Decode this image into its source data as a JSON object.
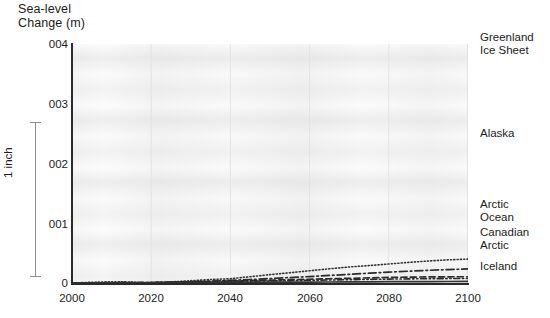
{
  "chart_data": {
    "type": "line",
    "title": "Sea-level\nChange (m)",
    "xlabel": "",
    "ylabel": "Sea-level Change (m)",
    "xlim": [
      2000,
      2100
    ],
    "ylim": [
      0,
      0.04
    ],
    "grid": true,
    "legend_position": "right-inline",
    "x_ticks": [
      "2000",
      "2020",
      "2040",
      "2060",
      "2080",
      "2100"
    ],
    "x_tick_values": [
      2000,
      2020,
      2040,
      2060,
      2080,
      2100
    ],
    "y_ticks": [
      "0",
      "001",
      "002",
      "003",
      "004"
    ],
    "y_tick_values": [
      0,
      0.001,
      0.002,
      0.003,
      0.004
    ],
    "scale_annotation": "1 inch",
    "x": [
      2000,
      2005,
      2010,
      2013,
      2016,
      2018,
      2020,
      2025,
      2030,
      2035,
      2040,
      2045,
      2050,
      2055,
      2060,
      2065,
      2070,
      2075,
      2080,
      2085,
      2090,
      2095,
      2100
    ],
    "series": [
      {
        "name": "Greenland Ice Sheet",
        "label": "Greenland\nIce Sheet",
        "style": "dotted",
        "color": "#333333",
        "values": [
          0.0,
          0.00012,
          0.00022,
          0.00021,
          0.00012,
          4e-05,
          3e-05,
          0.00018,
          0.00038,
          0.00058,
          0.00072,
          0.00105,
          0.0014,
          0.00172,
          0.00205,
          0.00238,
          0.00268,
          0.00292,
          0.00318,
          0.00345,
          0.00368,
          0.00388,
          0.004
        ]
      },
      {
        "name": "Alaska",
        "label": "Alaska",
        "style": "dash-dot",
        "color": "#2a2a2a",
        "values": [
          0.0,
          2e-05,
          4e-05,
          5e-05,
          6e-05,
          7e-05,
          8e-05,
          0.00014,
          0.00022,
          0.00032,
          0.00044,
          0.00058,
          0.00074,
          0.00091,
          0.00108,
          0.00126,
          0.00145,
          0.00164,
          0.00182,
          0.00198,
          0.00212,
          0.00225,
          0.00235
        ]
      },
      {
        "name": "Arctic Ocean",
        "label": "Arctic\nOcean",
        "style": "dashed",
        "color": "#2a2a2a",
        "values": [
          0.0,
          2e-05,
          4e-05,
          5e-05,
          6e-05,
          7e-05,
          8e-05,
          0.00013,
          0.00019,
          0.00026,
          0.00033,
          0.00041,
          0.00048,
          0.00056,
          0.00063,
          0.00071,
          0.00078,
          0.00086,
          0.00093,
          0.00098,
          0.00102,
          0.00104,
          0.00105
        ]
      },
      {
        "name": "Canadian Arctic",
        "label": "Canadian\nArctic",
        "style": "dash-dot-dot",
        "color": "#2a2a2a",
        "values": [
          0.0,
          1e-05,
          3e-05,
          4e-05,
          5e-05,
          6e-05,
          7e-05,
          0.00011,
          0.00015,
          0.0002,
          0.00025,
          0.0003,
          0.00035,
          0.0004,
          0.00045,
          0.0005,
          0.00055,
          0.0006,
          0.00065,
          0.00069,
          0.00072,
          0.00074,
          0.00076
        ]
      },
      {
        "name": "Iceland",
        "label": "Iceland",
        "style": "solid",
        "color": "#333333",
        "values": [
          0.0,
          1e-05,
          2e-05,
          2e-05,
          3e-05,
          3e-05,
          4e-05,
          5e-05,
          7e-05,
          8e-05,
          0.0001,
          0.00011,
          0.00013,
          0.00014,
          0.00016,
          0.00017,
          0.00019,
          0.0002,
          0.00022,
          0.00023,
          0.00024,
          0.00025,
          0.00026
        ]
      }
    ]
  },
  "labels": {
    "title": "Sea-level\nChange (m)",
    "scale": "1 inch",
    "y0": "0",
    "y1": "001",
    "y2": "002",
    "y3": "003",
    "y4": "004",
    "x0": "2000",
    "x1": "2020",
    "x2": "2040",
    "x3": "2060",
    "x4": "2080",
    "x5": "2100",
    "s0": "Greenland\nIce Sheet",
    "s1": "Alaska",
    "s2": "Arctic\nOcean",
    "s3": "Canadian\nArctic",
    "s4": "Iceland"
  }
}
